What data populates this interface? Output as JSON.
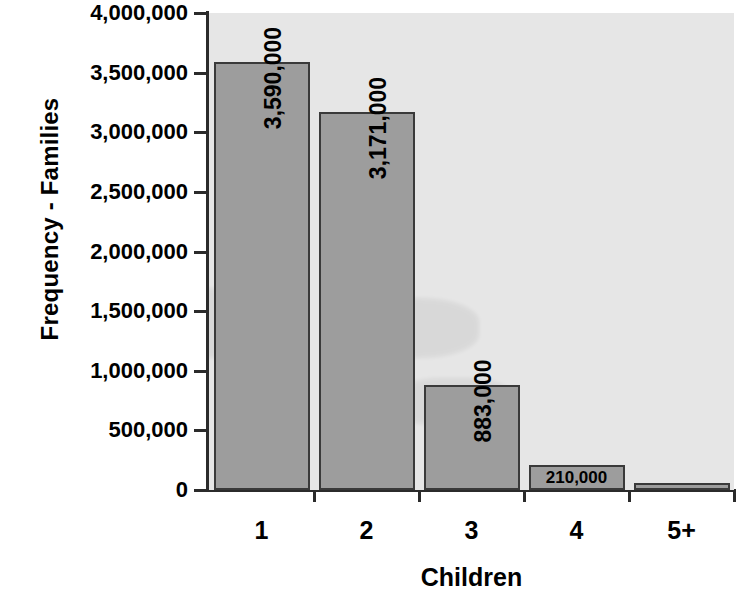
{
  "chart_data": {
    "type": "bar",
    "title": "",
    "xlabel": "Children",
    "ylabel": "Frequency - Families",
    "categories": [
      "1",
      "2",
      "3",
      "4",
      "5+"
    ],
    "values": [
      3590000,
      3171000,
      883000,
      210000,
      60000
    ],
    "data_labels": [
      "3,590,000",
      "3,171,000",
      "883,000",
      "210,000",
      ""
    ],
    "data_label_orientation": [
      "vertical",
      "vertical",
      "vertical",
      "horizontal",
      "none"
    ],
    "ylim": [
      0,
      4000000
    ],
    "ytick_values": [
      4000000,
      3500000,
      3000000,
      2500000,
      2000000,
      1500000,
      1000000,
      500000,
      0
    ],
    "ytick_labels": [
      "4,000,000",
      "3,500,000",
      "3,000,000",
      "2,500,000",
      "2,000,000",
      "1,500,000",
      "1,000,000",
      "500,000",
      "0"
    ],
    "grid": false,
    "legend": false,
    "series": [
      {
        "name": "Families",
        "values": [
          3590000,
          3171000,
          883000,
          210000,
          60000
        ]
      }
    ]
  },
  "style": {
    "plot_background": "#e6e6e6",
    "bar_fill": "#9d9d9d",
    "bar_border": "#3a3a3a",
    "axis_color": "#2b2b2b",
    "text_color": "#000000",
    "page_background": "#ffffff"
  }
}
